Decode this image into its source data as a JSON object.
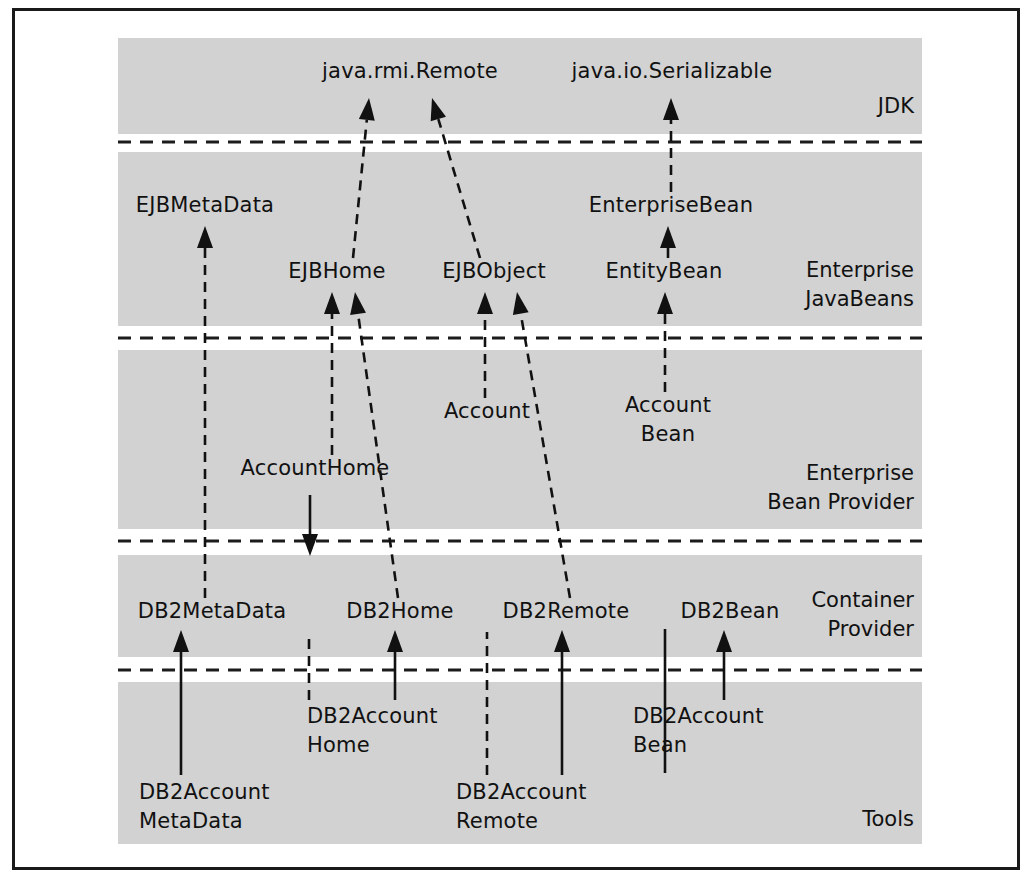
{
  "diagram": {
    "frame_color": "#1a1a1a",
    "band_color": "#d2d2d2",
    "line_color": "#111111",
    "bands": [
      {
        "id": "jdk",
        "label": "JDK",
        "label_lines": [
          "JDK"
        ],
        "y": 38,
        "height": 96,
        "label_y": 113
      },
      {
        "id": "ejb",
        "label": "Enterprise JavaBeans",
        "label_lines": [
          "Enterprise",
          "JavaBeans"
        ],
        "y": 152,
        "height": 174,
        "label_y": 277
      },
      {
        "id": "bean",
        "label": "Enterprise Bean Provider",
        "label_lines": [
          "Enterprise",
          "Bean Provider"
        ],
        "y": 350,
        "height": 179,
        "label_y": 480
      },
      {
        "id": "container",
        "label": "Container Provider",
        "label_lines": [
          "Container",
          "Provider"
        ],
        "y": 555,
        "height": 102,
        "label_y": 607
      },
      {
        "id": "tools",
        "label": "Tools",
        "label_lines": [
          "Tools"
        ],
        "y": 682,
        "height": 162,
        "label_y": 826
      }
    ],
    "separators": [
      142,
      338,
      541,
      670
    ],
    "nodes": [
      {
        "id": "java_rmi_remote",
        "label": "java.rmi.Remote",
        "lines": [
          "java.rmi.Remote"
        ],
        "band": "jdk",
        "x": 410,
        "y": 78,
        "anchor": "middle"
      },
      {
        "id": "java_io_serializable",
        "label": "java.io.Serializable",
        "lines": [
          "java.io.Serializable"
        ],
        "band": "jdk",
        "x": 672,
        "y": 78,
        "anchor": "middle"
      },
      {
        "id": "ejb_metadata",
        "label": "EJBMetaData",
        "lines": [
          "EJBMetaData"
        ],
        "band": "ejb",
        "x": 205,
        "y": 212,
        "anchor": "middle"
      },
      {
        "id": "enterprise_bean",
        "label": "EnterpriseBean",
        "lines": [
          "EnterpriseBean"
        ],
        "band": "ejb",
        "x": 671,
        "y": 212,
        "anchor": "middle"
      },
      {
        "id": "ejb_home",
        "label": "EJBHome",
        "lines": [
          "EJBHome"
        ],
        "band": "ejb",
        "x": 337,
        "y": 278,
        "anchor": "middle"
      },
      {
        "id": "ejb_object",
        "label": "EJBObject",
        "lines": [
          "EJBObject"
        ],
        "band": "ejb",
        "x": 494,
        "y": 278,
        "anchor": "middle"
      },
      {
        "id": "entity_bean",
        "label": "EntityBean",
        "lines": [
          "EntityBean"
        ],
        "band": "ejb",
        "x": 664,
        "y": 278,
        "anchor": "middle"
      },
      {
        "id": "account",
        "label": "Account",
        "lines": [
          "Account"
        ],
        "band": "bean",
        "x": 487,
        "y": 418,
        "anchor": "middle"
      },
      {
        "id": "account_bean",
        "label": "AccountBean",
        "lines": [
          "Account",
          "Bean"
        ],
        "band": "bean",
        "x": 668,
        "y": 412,
        "anchor": "middle"
      },
      {
        "id": "account_home",
        "label": "AccountHome",
        "lines": [
          "AccountHome"
        ],
        "band": "bean",
        "x": 315,
        "y": 475,
        "anchor": "middle"
      },
      {
        "id": "db2_metadata",
        "label": "DB2MetaData",
        "lines": [
          "DB2MetaData"
        ],
        "band": "container",
        "x": 212,
        "y": 618,
        "anchor": "middle"
      },
      {
        "id": "db2_home",
        "label": "DB2Home",
        "lines": [
          "DB2Home"
        ],
        "band": "container",
        "x": 400,
        "y": 618,
        "anchor": "middle"
      },
      {
        "id": "db2_remote",
        "label": "DB2Remote",
        "lines": [
          "DB2Remote"
        ],
        "band": "container",
        "x": 566,
        "y": 618,
        "anchor": "middle"
      },
      {
        "id": "db2_bean",
        "label": "DB2Bean",
        "lines": [
          "DB2Bean"
        ],
        "band": "container",
        "x": 730,
        "y": 618,
        "anchor": "middle"
      },
      {
        "id": "db2_account_home",
        "label": "DB2AccountHome",
        "lines": [
          "DB2Account",
          "Home"
        ],
        "band": "tools",
        "x": 307,
        "y": 723,
        "anchor": "start"
      },
      {
        "id": "db2_account_bean",
        "label": "DB2AccountBean",
        "lines": [
          "DB2Account",
          "Bean"
        ],
        "band": "tools",
        "x": 633,
        "y": 723,
        "anchor": "start"
      },
      {
        "id": "db2_account_metadata",
        "label": "DB2AccountMetaData",
        "lines": [
          "DB2Account",
          "MetaData"
        ],
        "band": "tools",
        "x": 139,
        "y": 799,
        "anchor": "start"
      },
      {
        "id": "db2_account_remote",
        "label": "DB2AccountRemote",
        "lines": [
          "DB2Account",
          "Remote"
        ],
        "band": "tools",
        "x": 456,
        "y": 799,
        "anchor": "start"
      }
    ],
    "edges": [
      {
        "id": "e1",
        "from": "ejb_home",
        "to": "java_rmi_remote",
        "style": "dashed",
        "x1": 353,
        "y1": 258,
        "x2": 369,
        "y2": 98
      },
      {
        "id": "e2",
        "from": "ejb_object",
        "to": "java_rmi_remote",
        "style": "dashed",
        "x1": 480,
        "y1": 258,
        "x2": 432,
        "y2": 98
      },
      {
        "id": "e3",
        "from": "enterprise_bean",
        "to": "java_io_serializable",
        "style": "dashed",
        "x1": 671,
        "y1": 192,
        "x2": 671,
        "y2": 98
      },
      {
        "id": "e4",
        "from": "entity_bean",
        "to": "enterprise_bean",
        "style": "dashed",
        "x1": 668,
        "y1": 258,
        "x2": 668,
        "y2": 226
      },
      {
        "id": "e5",
        "from": "db2_metadata",
        "to": "ejb_metadata",
        "style": "dashed",
        "x1": 205,
        "y1": 598,
        "x2": 205,
        "y2": 226
      },
      {
        "id": "e6",
        "from": "account_home",
        "to": "ejb_home",
        "style": "dashed",
        "x1": 332,
        "y1": 455,
        "x2": 332,
        "y2": 292
      },
      {
        "id": "e7",
        "from": "db2_home",
        "to": "ejb_home",
        "style": "dashed",
        "x1": 398,
        "y1": 598,
        "x2": 355,
        "y2": 292
      },
      {
        "id": "e8",
        "from": "account",
        "to": "ejb_object",
        "style": "dashed",
        "x1": 485,
        "y1": 398,
        "x2": 485,
        "y2": 292
      },
      {
        "id": "e9",
        "from": "db2_remote",
        "to": "ejb_object",
        "style": "dashed",
        "x1": 570,
        "y1": 598,
        "x2": 517,
        "y2": 292
      },
      {
        "id": "e10",
        "from": "account_bean",
        "to": "entity_bean",
        "style": "dashed",
        "x1": 665,
        "y1": 392,
        "x2": 665,
        "y2": 292
      },
      {
        "id": "e11",
        "from": "db2_account_metadata",
        "to": "db2_metadata",
        "style": "solid",
        "x1": 181,
        "y1": 775,
        "x2": 181,
        "y2": 630
      },
      {
        "id": "e12",
        "from": "db2_account_home",
        "to": "db2_home",
        "style": "solid",
        "x1": 395,
        "y1": 700,
        "x2": 395,
        "y2": 630
      },
      {
        "id": "e13",
        "from": "db2_account_remote",
        "to": "db2_remote",
        "style": "solid",
        "x1": 562,
        "y1": 775,
        "x2": 562,
        "y2": 630
      },
      {
        "id": "e14",
        "from": "db2_account_bean",
        "to": "db2_bean",
        "style": "solid",
        "x1": 724,
        "y1": 700,
        "x2": 724,
        "y2": 630
      },
      {
        "id": "e15",
        "from": "db2_account_metadata",
        "to": "account_home_chain",
        "style": "dashed",
        "x1": 309,
        "y1": 700,
        "x2": 309,
        "y2": 632
      },
      {
        "id": "e16",
        "from": "db2_account_remote",
        "to": "account_chain",
        "style": "dashed",
        "x1": 487,
        "y1": 775,
        "x2": 487,
        "y2": 632
      },
      {
        "id": "e17",
        "from": "account_bean_through",
        "to": "db2_bean_band",
        "style": "solid",
        "x1": 665,
        "y1": 773,
        "x2": 665,
        "y2": 629
      },
      {
        "id": "e18",
        "from": "db2_account_home",
        "to": "account_home",
        "style": "solid",
        "x1": 310,
        "y1": 495,
        "x2": 310,
        "y2": 556
      }
    ],
    "band_extent": {
      "x": 118,
      "width": 804
    }
  }
}
